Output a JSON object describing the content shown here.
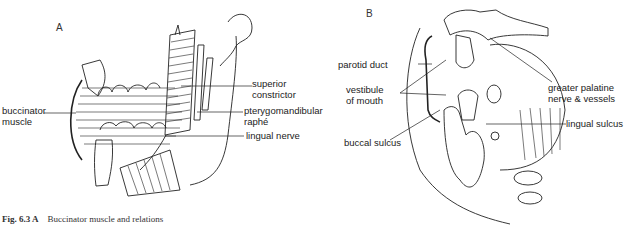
{
  "figure": {
    "caption_label": "Fig. 6.3 A",
    "caption_text": "Buccinator muscle and relations"
  },
  "panel_a": {
    "letter": "A",
    "labels": {
      "superior_constrictor": "superior\nconstrictor",
      "pterygomandibular_raphe": "pterygomandibular\nraphé",
      "buccinator_muscle": "buccinator\nmuscle",
      "lingual_nerve": "lingual nerve"
    }
  },
  "panel_b": {
    "letter": "B",
    "labels": {
      "parotid_duct": "parotid duct",
      "vestibule_of_mouth": "vestibule\nof mouth",
      "buccal_sulcus": "buccal sulcus",
      "greater_palatine": "greater palatine\nnerve & vessels",
      "lingual_sulcus": "lingual sulcus"
    }
  }
}
